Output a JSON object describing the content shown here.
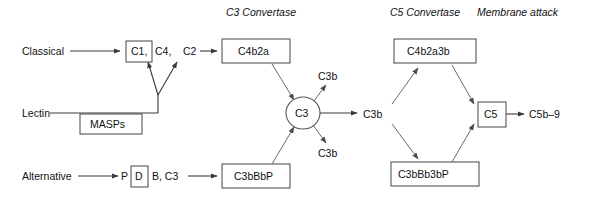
{
  "figure": {
    "type": "flow-diagram",
    "background_color": "#ffffff",
    "line_color": "#3a3a3c",
    "box_stroke_color": "#555558",
    "text_color": "#111113"
  },
  "headers": [
    {
      "id": "c3-convertase",
      "label": "C3 Convertase",
      "x": 226,
      "y": 16
    },
    {
      "id": "c5-convertase",
      "label": "C5 Convertase",
      "x": 390,
      "y": 16
    },
    {
      "id": "membrane-attack",
      "label": "Membrane attack",
      "x": 477,
      "y": 16
    }
  ],
  "pathways": [
    {
      "id": "classical",
      "label": "Classical",
      "x": 22,
      "y": 54
    },
    {
      "id": "lectin",
      "label": "Lectin",
      "x": 22,
      "y": 117
    },
    {
      "id": "alternative",
      "label": "Alternative",
      "x": 22,
      "y": 179
    }
  ],
  "nodes": {
    "c1": {
      "label": "C1,",
      "x": 126,
      "y": 41,
      "w": 26,
      "h": 21
    },
    "c4": {
      "label": "C4,",
      "x": 156,
      "y": 55
    },
    "c2": {
      "label": "C2",
      "x": 184,
      "y": 55
    },
    "masps": {
      "label": "MASPs",
      "x": 80,
      "y": 114,
      "w": 62,
      "h": 20
    },
    "p": {
      "label": "P",
      "x": 123,
      "y": 179
    },
    "d": {
      "label": "D",
      "x": 131,
      "y": 168,
      "w": 17,
      "h": 21
    },
    "b_c3": {
      "label": "B,  C3",
      "x": 152,
      "y": 179
    },
    "c4b2a": {
      "label": "C4b2a",
      "x": 222,
      "y": 39,
      "w": 68,
      "h": 24
    },
    "c3bbbp": {
      "label": "C3bBbP",
      "x": 222,
      "y": 166,
      "w": 68,
      "h": 24
    },
    "c3": {
      "label": "C3",
      "cx": 303,
      "cy": 113,
      "rx": 17,
      "ry": 16
    },
    "c3b_upper": {
      "label": "C3b",
      "x": 318,
      "y": 80
    },
    "c3b_middle": {
      "label": "C3b",
      "x": 363,
      "y": 118
    },
    "c3b_lower": {
      "label": "C3b",
      "x": 318,
      "y": 155
    },
    "c4b2a3b": {
      "label": "C4b2a3b",
      "x": 394,
      "y": 39,
      "w": 82,
      "h": 24
    },
    "c3bbb3bp": {
      "label": "C3bBb3bP",
      "x": 391,
      "y": 164,
      "w": 88,
      "h": 24
    },
    "c5": {
      "label": "C5",
      "x": 478,
      "y": 102,
      "w": 28,
      "h": 25
    },
    "c5b9": {
      "label": "C5b–9",
      "x": 529,
      "y": 118
    }
  },
  "edges": [
    {
      "id": "classical-to-c1",
      "from": "classical",
      "to": "c1",
      "arrow": true
    },
    {
      "id": "c2-to-c4b2a",
      "from": "c2",
      "to": "c4b2a",
      "arrow": true
    },
    {
      "id": "lectin-to-junction",
      "from": "lectin",
      "to": "y-junction",
      "arrow": false
    },
    {
      "id": "junction-to-c4",
      "from": "y-junction",
      "to": "c4",
      "arrow": true
    },
    {
      "id": "junction-to-c2",
      "from": "y-junction",
      "to": "c2",
      "arrow": true
    },
    {
      "id": "alternative-to-p",
      "from": "alternative",
      "to": "p",
      "arrow": true
    },
    {
      "id": "bc3-to-c3bbbp",
      "from": "b_c3",
      "to": "c3bbbp",
      "arrow": true
    },
    {
      "id": "c4b2a-to-c3",
      "from": "c4b2a",
      "to": "c3",
      "arrow": true
    },
    {
      "id": "c3bbbp-to-c3",
      "from": "c3bbbp",
      "to": "c3",
      "arrow": true
    },
    {
      "id": "c3-to-c3b-upper",
      "from": "c3",
      "to": "c3b_upper",
      "arrow": true
    },
    {
      "id": "c3-to-c3b-middle",
      "from": "c3",
      "to": "c3b_middle",
      "arrow": true
    },
    {
      "id": "c3-to-c3b-lower",
      "from": "c3",
      "to": "c3b_lower",
      "arrow": true
    },
    {
      "id": "c3b-to-c4b2a3b",
      "from": "c3b_middle",
      "to": "c4b2a3b",
      "arrow": true
    },
    {
      "id": "c3b-to-c3bbb3bp",
      "from": "c3b_middle",
      "to": "c3bbb3bp",
      "arrow": true
    },
    {
      "id": "c4b2a3b-to-c5",
      "from": "c4b2a3b",
      "to": "c5",
      "arrow": true
    },
    {
      "id": "c3bbb3bp-to-c5",
      "from": "c3bbb3bp",
      "to": "c5",
      "arrow": true
    },
    {
      "id": "c5-to-c5b9",
      "from": "c5",
      "to": "c5b9",
      "arrow": true
    }
  ]
}
